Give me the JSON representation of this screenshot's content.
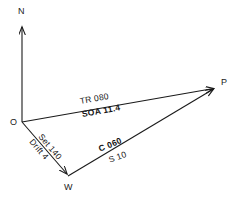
{
  "diagram": {
    "background_color": "#ffffff",
    "line_color": "#1a1a1a",
    "vertices": {
      "origin": {
        "label": "O",
        "x": 22,
        "y": 122
      },
      "position": {
        "label": "P",
        "x": 215,
        "y": 88
      },
      "water": {
        "label": "W",
        "x": 68,
        "y": 176
      },
      "north": {
        "label": "N",
        "x": 22,
        "y": 25
      }
    },
    "edges": {
      "north_arrow": {
        "name": "north-arrow",
        "from": "origin",
        "to": "north"
      },
      "track": {
        "name": "track-vector",
        "from": "origin",
        "to": "position",
        "label_top": "TR 080",
        "label_bottom": "SOA 11.4"
      },
      "current": {
        "name": "current-vector",
        "from": "origin",
        "to": "water",
        "label_top": "Set 140",
        "label_bottom": "Drift 4"
      },
      "heading": {
        "name": "heading-vector",
        "from": "water",
        "to": "position",
        "label_top": "C 060",
        "label_bottom": "S  10"
      }
    }
  }
}
